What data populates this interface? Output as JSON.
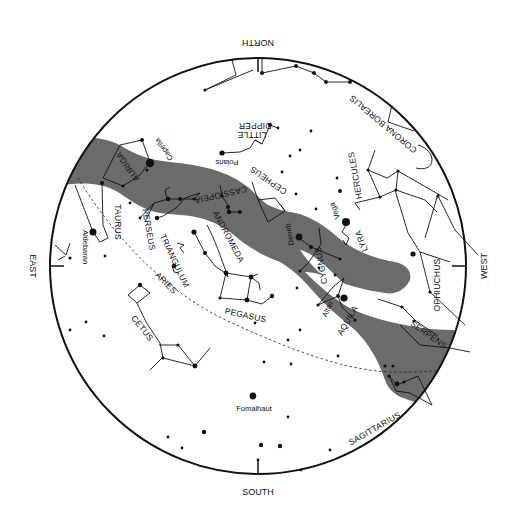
{
  "chart_title": "Sky map",
  "directions": {
    "north": "NORTH",
    "south": "SOUTH",
    "east": "EAST",
    "west": "WEST"
  },
  "constellations": {
    "auriga": "AURIGA",
    "taurus": "TAURUS",
    "perseus": "PERSEUS",
    "triangulum": "TRIANGULUM",
    "aries": "ARIES",
    "cetus": "CETUS",
    "cassiopeia": "CASSIOPEIA",
    "andromeda": "ANDROMEDA",
    "pegasus": "PEGASUS",
    "cepheus": "CEPHEUS",
    "little_dipper_1": "LITTLE",
    "little_dipper_2": "DIPPER",
    "corona_borealis": "CORONA BOREALIS",
    "hercules": "HERCULES",
    "lyra": "LYRA",
    "cygnus": "CYGNUS",
    "aquila": "AQUILA",
    "ophiuchus": "OPHIUCHUS",
    "serpens": "SERPENS",
    "sagittarius": "SAGITTARIUS"
  },
  "stars": {
    "capella": "Capella",
    "aldebaran": "Aldebaran",
    "polaris": "Polaris",
    "vega": "Vega",
    "deneb": "Deneb",
    "altair": "Altair",
    "fomalhaut": "Fomalhaut"
  },
  "colors": {
    "milky_way": "#6b6b6b",
    "ink": "#111111",
    "background": "#ffffff"
  }
}
